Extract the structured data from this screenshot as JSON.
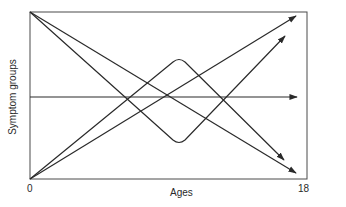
{
  "diagram": {
    "type": "developmental-trajectories",
    "x_axis": {
      "label": "Ages",
      "tick_start": "0",
      "tick_end": "18"
    },
    "y_axis": {
      "label": "Symptom groups"
    },
    "trajectories": [
      {
        "name": "high-decreasing-steep",
        "from": "top-left",
        "to": "lower-right"
      },
      {
        "name": "high-decreasing",
        "from": "top-left",
        "to": "bottom-right"
      },
      {
        "name": "low-increasing",
        "from": "bottom-left",
        "to": "top-right"
      },
      {
        "name": "low-increasing-steep",
        "from": "bottom-left",
        "to": "upper-right"
      },
      {
        "name": "stable",
        "from": "middle-left",
        "to": "middle-right"
      },
      {
        "name": "rise-then-fall",
        "from": "bottom-left",
        "peak": "middle",
        "to": "lower-right"
      },
      {
        "name": "fall-then-rise",
        "from": "top-left",
        "trough": "middle",
        "to": "upper-right"
      }
    ],
    "colors": {
      "line": "#2a2a2a",
      "frame": "#3a3a3a",
      "background": "#ffffff"
    }
  }
}
